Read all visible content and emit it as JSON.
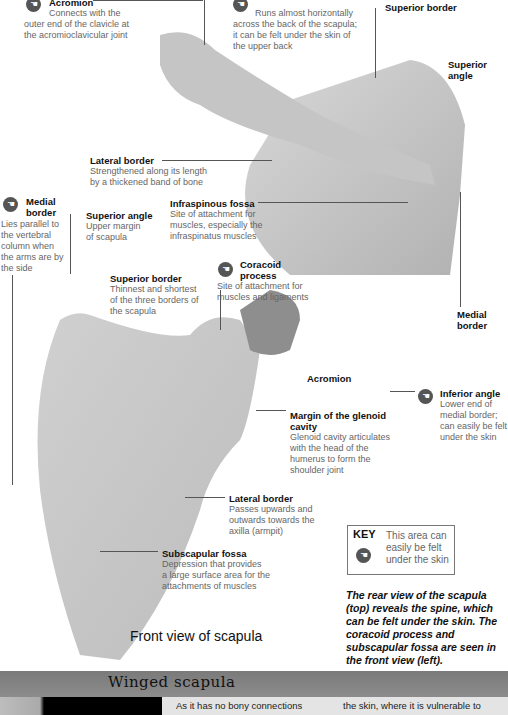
{
  "rear_view": {
    "labels": {
      "acromion": {
        "title": "Acromion",
        "body": [
          "Connects with the",
          "outer end of the clavicle at",
          "the acromioclavicular joint"
        ]
      },
      "spine": {
        "title": "Spine",
        "body": [
          "Runs almost horizontally",
          "across the back of the scapula;",
          "it can be felt under the skin of",
          "the upper back"
        ]
      },
      "superior_border": {
        "title": "Superior border"
      },
      "superior_angle": {
        "title": "Superior",
        "title2": "angle"
      },
      "lateral_border": {
        "title": "Lateral border",
        "body": [
          "Strengthened along its length",
          "by a thickened band of bone"
        ]
      },
      "infraspinous_fossa": {
        "title": "Infraspinous fossa",
        "body": [
          "Site of attachment for",
          "muscles, especially the",
          "infraspinatus muscles"
        ]
      },
      "medial_border_right": {
        "title": "Medial",
        "title2": "border"
      },
      "inferior_angle": {
        "title": "Inferior angle",
        "body": [
          "Lower end of",
          "medial border;",
          "can easily be felt",
          "under the skin"
        ]
      }
    }
  },
  "front_view": {
    "title": "Front view of scapula",
    "labels": {
      "medial_border": {
        "title": "Medial",
        "title2": "border",
        "body": [
          "Lies parallel to",
          "the vertebral",
          "column when",
          "the arms are by",
          "the side"
        ]
      },
      "superior_angle": {
        "title": "Superior angle",
        "body": [
          "Upper margin",
          "of scapula"
        ]
      },
      "coracoid_process": {
        "title": "Coracoid",
        "title2": "process",
        "body": [
          "Site of attachment for",
          "muscles and ligaments"
        ]
      },
      "superior_border": {
        "title": "Superior border",
        "body": [
          "Thinnest and shortest",
          "of the three borders of",
          "the scapula"
        ]
      },
      "acromion": {
        "title": "Acromion"
      },
      "glenoid": {
        "title": "Margin of the glenoid",
        "title2": "cavity",
        "body": [
          "Glenoid cavity articulates",
          "with the head of the",
          "humerus to form the",
          "shoulder joint"
        ]
      },
      "lateral_border": {
        "title": "Lateral border",
        "body": [
          "Passes upwards and",
          "outwards towards the",
          "axilla (armpit)"
        ]
      },
      "subscapular_fossa": {
        "title": "Subscapular fossa",
        "body": [
          "Depression that provides",
          "a large surface area for the",
          "attachments of muscles"
        ]
      }
    }
  },
  "key": {
    "label": "KEY",
    "text": [
      "This area can",
      "easily be felt",
      "under the skin"
    ],
    "icon": "hand-palpation-icon"
  },
  "caption": "The rear view of the scapula (top) reveals the spine, which can be felt under the skin. The coracoid process and subscapular fossa are seen in the front view (left).",
  "winged_scapula": {
    "title": "Winged scapula",
    "col1": "As it has no bony connections",
    "col2": "the skin, where it is vulnerable to"
  },
  "icons": {
    "hand": "☚"
  }
}
